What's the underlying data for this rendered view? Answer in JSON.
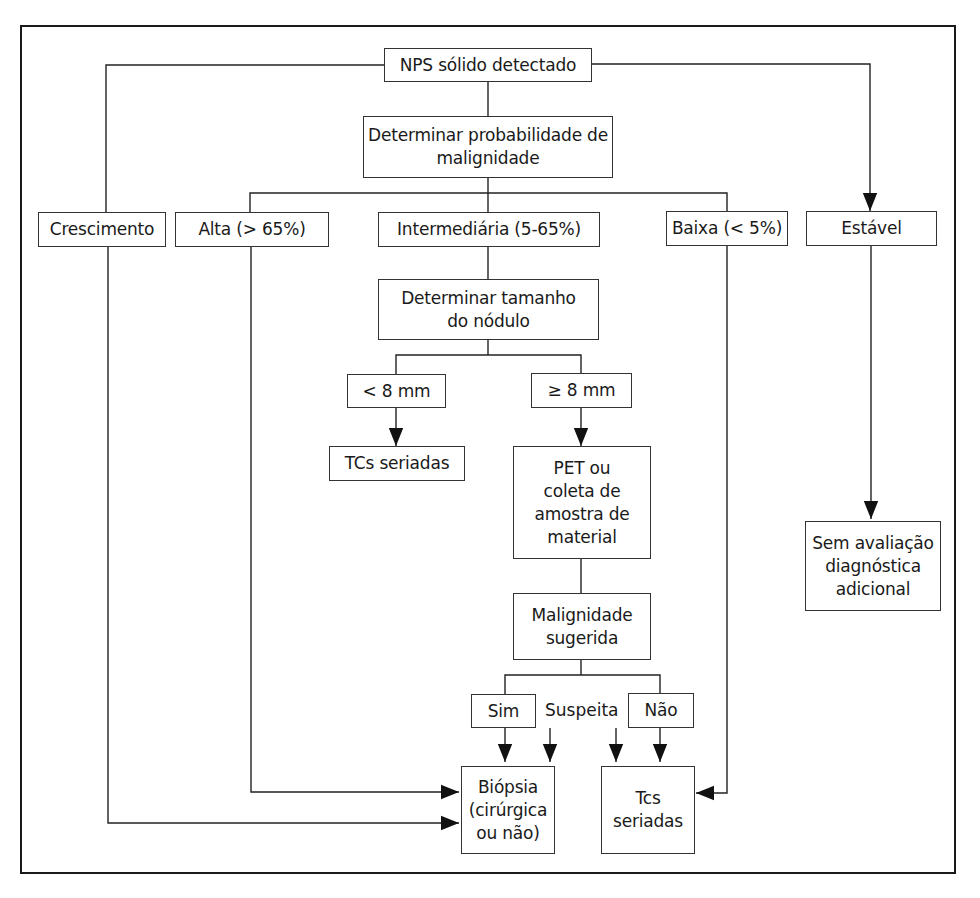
{
  "diagram": {
    "type": "flowchart",
    "nodes": {
      "start": "NPS sólido detectado",
      "prob": "Determinar probabilidade de malignidade",
      "growth": "Crescimento",
      "high": "Alta (> 65%)",
      "intermediate": "Intermediária (5-65%)",
      "low": "Baixa (< 5%)",
      "stable": "Estável",
      "size": "Determinar tamanho do nódulo",
      "lt8": "< 8 mm",
      "ge8": "≥ 8 mm",
      "serial_ct_small": "TCs seriadas",
      "pet": "PET ou coleta de amostra de material",
      "malig": "Malignidade sugerida",
      "yes": "Sim",
      "suspect": "Suspeita",
      "no": "Não",
      "biopsy": "Biópsia (cirúrgica ou não)",
      "serial_ct": "Tcs seriadas",
      "no_eval": "Sem avaliação diagnóstica adicional"
    },
    "edges": [
      [
        "start",
        "prob"
      ],
      [
        "start",
        "growth"
      ],
      [
        "start",
        "stable"
      ],
      [
        "prob",
        "high"
      ],
      [
        "prob",
        "intermediate"
      ],
      [
        "prob",
        "low"
      ],
      [
        "intermediate",
        "size"
      ],
      [
        "size",
        "lt8"
      ],
      [
        "size",
        "ge8"
      ],
      [
        "lt8",
        "serial_ct_small"
      ],
      [
        "ge8",
        "pet"
      ],
      [
        "pet",
        "malig"
      ],
      [
        "malig",
        "yes"
      ],
      [
        "malig",
        "no"
      ],
      [
        "yes",
        "biopsy"
      ],
      [
        "suspect",
        "biopsy"
      ],
      [
        "suspect",
        "serial_ct"
      ],
      [
        "no",
        "serial_ct"
      ],
      [
        "high",
        "biopsy"
      ],
      [
        "growth",
        "biopsy"
      ],
      [
        "low",
        "serial_ct"
      ],
      [
        "stable",
        "no_eval"
      ]
    ]
  }
}
